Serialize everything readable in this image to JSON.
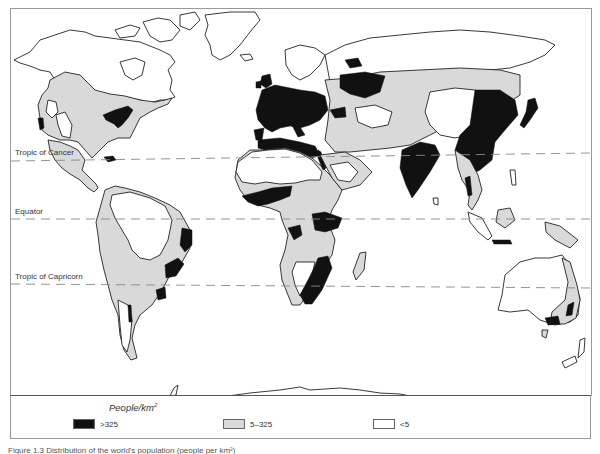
{
  "figure": {
    "caption": "Figure 1.3 Distribution of the world's population (people per km²)",
    "colors": {
      "dense": "#111111",
      "mid": "#d9d9d9",
      "low": "#ffffff",
      "frame": "#999999"
    }
  },
  "map": {
    "reference_lines": [
      {
        "name": "Tropic of Cancer",
        "label": "Tropic of Cancer",
        "y_left": 161,
        "y_right": 153
      },
      {
        "name": "Equator",
        "label": "Equator",
        "y_left": 219,
        "y_right": 219
      },
      {
        "name": "Tropic of Capricorn",
        "label": "Tropic of Capricorn",
        "y_left": 284,
        "y_right": 288
      }
    ],
    "regions": {
      "dense": [
        "Eastern USA",
        "California coast",
        "Western & Central Europe",
        "European Russia",
        "Nile valley",
        "India",
        "Eastern China",
        "Japan",
        "Java",
        "West Africa coast",
        "East Africa highlands",
        "Southeast Africa",
        "Eastern Brazil",
        "Southeast Australia"
      ],
      "mid": [
        "Central & Eastern North America",
        "Mexico & Central America",
        "Andes & Eastern South America",
        "Sub-Saharan Africa",
        "Russia & Central Asia",
        "Middle East",
        "Southeast Asia",
        "Eastern Australia",
        "Madagascar"
      ],
      "low": [
        "Canada & Arctic",
        "Greenland",
        "Amazon basin",
        "Sahara",
        "Arabian desert",
        "Siberia",
        "Tibet & Mongolia",
        "Central Australia",
        "Antarctica"
      ]
    }
  },
  "legend": {
    "title": "People/km",
    "title_exponent": "2",
    "items": [
      {
        "label": ">325",
        "color": "#111111"
      },
      {
        "label": "5–325",
        "color": "#d9d9d9"
      },
      {
        "label": "<5",
        "color": "#ffffff"
      }
    ]
  }
}
